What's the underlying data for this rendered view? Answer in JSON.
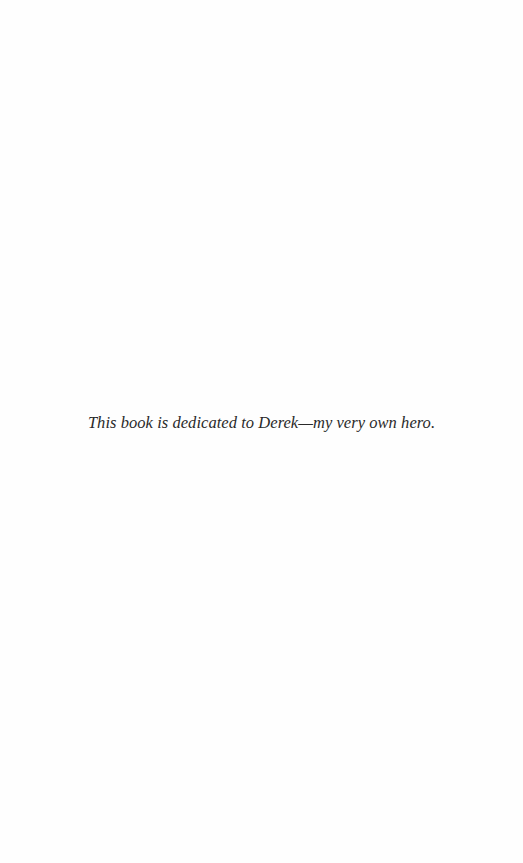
{
  "page": {
    "background": "#fefefe",
    "text_color": "#2a2a2a"
  },
  "dedication": {
    "text": "This book is dedicated to Derek—my very own hero."
  }
}
